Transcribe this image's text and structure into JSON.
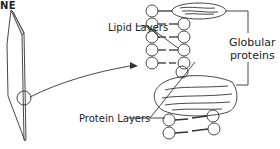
{
  "title": "NE",
  "labels": {
    "lipid_layers": "Lipid Layers",
    "globular_line1": "Globular",
    "globular_line2": "proteins",
    "protein_layers": "Protein Layers"
  },
  "colors": {
    "stroke": "#333333",
    "background": "#ffffff"
  }
}
